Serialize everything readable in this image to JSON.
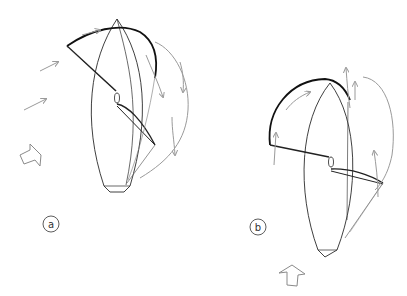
{
  "figures": [
    {
      "id": "a",
      "label": "a",
      "description": "Sailboat viewed from above with spinnaker set to windward; wind from the side (beam reach)",
      "wind_direction": "from left"
    },
    {
      "id": "b",
      "label": "b",
      "description": "Sailboat viewed from above with spinnaker set; wind from astern (running)",
      "wind_direction": "from below"
    }
  ],
  "colors": {
    "hull": "#2a2a2a",
    "sail": "#1a1a1a",
    "airflow_arrows": "#9a9a9a",
    "wind_arrow": "#8a8a8a",
    "background": "#ffffff"
  },
  "icons": {
    "wind_arrow_a": "hollow-arrow-right",
    "wind_arrow_b": "hollow-arrow-up",
    "label_badge": "circled-letter"
  }
}
